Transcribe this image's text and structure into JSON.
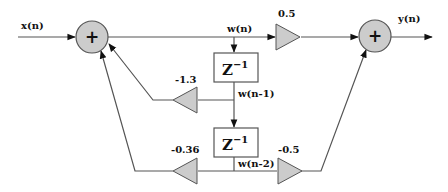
{
  "diagram": {
    "type": "signal-flow / IIR filter block diagram",
    "colors": {
      "line": "#555555",
      "fill": "#cccccc",
      "box_fill": "#ffffff",
      "text": "#111111"
    },
    "signals": {
      "input": "x(n)",
      "output": "y(n)",
      "w0": "w(n)",
      "w1": "w(n-1)",
      "w2": "w(n-2)"
    },
    "adders": {
      "left": {
        "symbol": "+"
      },
      "right": {
        "symbol": "+"
      }
    },
    "delays": {
      "d1": {
        "base": "Z",
        "exp": "−1"
      },
      "d2": {
        "base": "Z",
        "exp": "−1"
      }
    },
    "gains": {
      "feedforward_0": "0.5",
      "feedback_1": "-1.3",
      "feedback_2": "-0.36",
      "feedforward_2": "-0.5"
    }
  }
}
